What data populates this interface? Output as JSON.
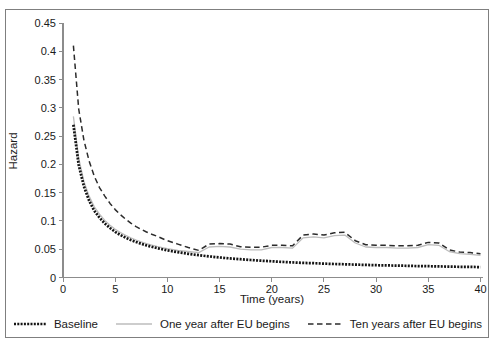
{
  "chart_data": {
    "type": "line",
    "title": "",
    "xlabel": "Time (years)",
    "ylabel": "Hazard",
    "xlim": [
      0,
      40
    ],
    "ylim": [
      0,
      0.45
    ],
    "x_ticks": [
      0,
      5,
      10,
      15,
      20,
      25,
      30,
      35,
      40
    ],
    "y_ticks": [
      0,
      0.05,
      0.1,
      0.15,
      0.2,
      0.25,
      0.3,
      0.35,
      0.4,
      0.45
    ],
    "y_tick_labels": [
      "0",
      "0.05",
      "0.1",
      "0.15",
      "0.2",
      "0.25",
      "0.3",
      "0.35",
      "0.4",
      "0.45"
    ],
    "grid": false,
    "legend_position": "bottom",
    "colors": {
      "axis": "#8c8c8c",
      "text": "#1a1a1a",
      "border": "#7f7f7f"
    },
    "x": [
      1,
      1.5,
      2,
      2.5,
      3,
      3.5,
      4,
      4.5,
      5,
      5.5,
      6,
      6.5,
      7,
      7.5,
      8,
      8.5,
      9,
      9.5,
      10,
      11,
      12,
      13,
      14,
      15,
      16,
      17,
      18,
      19,
      20,
      21,
      22,
      23,
      24,
      25,
      26,
      27,
      28,
      29,
      30,
      31,
      32,
      33,
      34,
      35,
      36,
      37,
      38,
      39,
      40
    ],
    "series": [
      {
        "name": "Baseline",
        "color": "#141414",
        "line_style": "thick-beaded",
        "values": [
          0.27,
          0.199,
          0.161,
          0.136,
          0.118,
          0.106,
          0.0955,
          0.0875,
          0.0807,
          0.0752,
          0.0704,
          0.0663,
          0.0627,
          0.0596,
          0.0568,
          0.0543,
          0.052,
          0.05,
          0.048,
          0.0447,
          0.0419,
          0.0394,
          0.0373,
          0.0354,
          0.0338,
          0.0323,
          0.0309,
          0.0297,
          0.0286,
          0.0276,
          0.0267,
          0.0259,
          0.0252,
          0.0245,
          0.0239,
          0.0233,
          0.0228,
          0.0223,
          0.0218,
          0.0214,
          0.021,
          0.0206,
          0.0202,
          0.0199,
          0.0196,
          0.0193,
          0.019,
          0.0187,
          0.0184
        ]
      },
      {
        "name": "One year after EU begins",
        "color": "#bcbcbc",
        "line_style": "solid",
        "values": [
          0.285,
          0.211,
          0.17,
          0.144,
          0.125,
          0.112,
          0.101,
          0.0925,
          0.0853,
          0.0795,
          0.0744,
          0.0701,
          0.0663,
          0.063,
          0.0601,
          0.0574,
          0.055,
          0.0529,
          0.051,
          0.048,
          0.046,
          0.044,
          0.054,
          0.055,
          0.054,
          0.05,
          0.049,
          0.049,
          0.053,
          0.053,
          0.052,
          0.07,
          0.072,
          0.07,
          0.074,
          0.075,
          0.061,
          0.054,
          0.053,
          0.053,
          0.052,
          0.052,
          0.053,
          0.058,
          0.057,
          0.046,
          0.042,
          0.041,
          0.039
        ]
      },
      {
        "name": "Ten years after EU begins",
        "color": "#2b2b2b",
        "line_style": "dashed",
        "values": [
          0.41,
          0.298,
          0.243,
          0.206,
          0.179,
          0.159,
          0.144,
          0.131,
          0.12,
          0.111,
          0.103,
          0.096,
          0.09,
          0.085,
          0.0805,
          0.0765,
          0.073,
          0.069,
          0.065,
          0.059,
          0.053,
          0.048,
          0.059,
          0.06,
          0.059,
          0.0545,
          0.0535,
          0.0535,
          0.057,
          0.057,
          0.056,
          0.075,
          0.077,
          0.075,
          0.079,
          0.08,
          0.065,
          0.058,
          0.057,
          0.057,
          0.056,
          0.056,
          0.057,
          0.062,
          0.061,
          0.049,
          0.045,
          0.044,
          0.042
        ]
      }
    ]
  }
}
